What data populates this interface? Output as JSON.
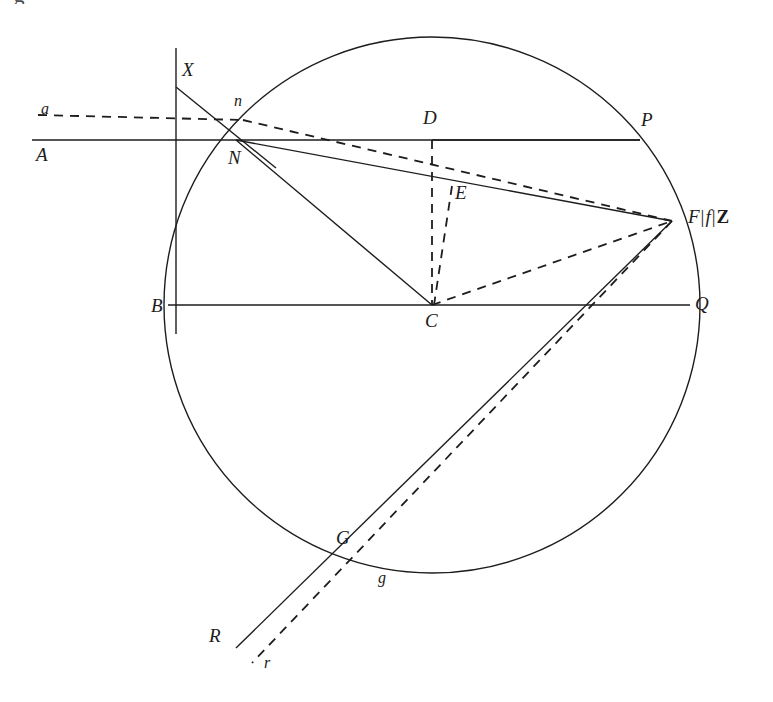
{
  "figure": {
    "domain_note": "Geometric optics ray diagram with circle, chords and refracted rays",
    "caption_remnant": "g",
    "stroke_color": "#1d1d1d",
    "background_color": "#ffffff",
    "solid_stroke_width": 1.4,
    "dashed_stroke_width": 1.8,
    "dash_pattern": "9 7"
  },
  "labels": [
    {
      "id": "label-a",
      "text": "a",
      "x": 41,
      "y": 101,
      "style": "lower"
    },
    {
      "id": "label-A",
      "text": "A",
      "x": 36,
      "y": 145,
      "style": "upper"
    },
    {
      "id": "label-X",
      "text": "X",
      "x": 182,
      "y": 60,
      "style": "upper"
    },
    {
      "id": "label-n",
      "text": "n",
      "x": 234,
      "y": 93,
      "style": "lower"
    },
    {
      "id": "label-N",
      "text": "N",
      "x": 228,
      "y": 148,
      "style": "upper"
    },
    {
      "id": "label-B",
      "text": "B",
      "x": 151,
      "y": 296,
      "style": "upper"
    },
    {
      "id": "label-D",
      "text": "D",
      "x": 423,
      "y": 108,
      "style": "upper"
    },
    {
      "id": "label-E",
      "text": "E",
      "x": 455,
      "y": 183,
      "style": "upper"
    },
    {
      "id": "label-C",
      "text": "C",
      "x": 425,
      "y": 311,
      "style": "upper"
    },
    {
      "id": "label-P",
      "text": "P",
      "x": 641,
      "y": 110,
      "style": "upper"
    },
    {
      "id": "label-Q",
      "text": "Q",
      "x": 695,
      "y": 294,
      "style": "upper"
    },
    {
      "id": "label-G",
      "text": "G",
      "x": 336,
      "y": 528,
      "style": "upper"
    },
    {
      "id": "label-g",
      "text": "g",
      "x": 378,
      "y": 570,
      "style": "lower"
    },
    {
      "id": "label-R",
      "text": "R",
      "x": 209,
      "y": 626,
      "style": "upper"
    },
    {
      "id": "label-r",
      "text": "r",
      "x": 264,
      "y": 655,
      "style": "lower"
    }
  ],
  "focus_label": {
    "id": "label-focus-F-f-Z",
    "text": "F|f|Z",
    "parts": {
      "F": "F",
      "sep1": "|",
      "f": "f",
      "sep2": "|",
      "Z": "Z"
    },
    "x": 688,
    "y": 207
  },
  "geometry": {
    "circle": {
      "cx": 432,
      "cy": 305,
      "r": 268
    },
    "points": {
      "X": {
        "x": 176,
        "y": 87
      },
      "n": {
        "x": 243,
        "y": 120
      },
      "N": {
        "x": 236,
        "y": 140
      },
      "B": {
        "x": 172,
        "y": 305
      },
      "C": {
        "x": 432,
        "y": 305
      },
      "D": {
        "x": 432,
        "y": 140
      },
      "E": {
        "x": 449,
        "y": 196
      },
      "P": {
        "x": 640,
        "y": 140
      },
      "Q": {
        "x": 690,
        "y": 305
      },
      "F": {
        "x": 672,
        "y": 221
      },
      "G": {
        "x": 357,
        "y": 558
      },
      "g": {
        "x": 370,
        "y": 570
      },
      "R": {
        "x": 236,
        "y": 648
      },
      "r": {
        "x": 252,
        "y": 663
      }
    },
    "solid_segments": [
      {
        "name": "axis-A-to-P",
        "x1": 32,
        "y1": 140,
        "x2": 640,
        "y2": 140
      },
      {
        "name": "chord-B-to-Q",
        "x1": 168,
        "y1": 305,
        "x2": 690,
        "y2": 305
      },
      {
        "name": "vertical-tangent",
        "x1": 176,
        "y1": 48,
        "x2": 176,
        "y2": 334
      },
      {
        "name": "ray-X-to-N-extended",
        "x1": 176,
        "y1": 87,
        "x2": 276,
        "y2": 168
      },
      {
        "name": "ray-N-to-F",
        "x1": 236,
        "y1": 140,
        "x2": 672,
        "y2": 221
      },
      {
        "name": "ray-N-to-C",
        "x1": 236,
        "y1": 140,
        "x2": 432,
        "y2": 305
      },
      {
        "name": "ray-F-to-R",
        "x1": 672,
        "y1": 221,
        "x2": 236,
        "y2": 648
      },
      {
        "name": "chord-D-to-P-top",
        "x1": 432,
        "y1": 140,
        "x2": 640,
        "y2": 140
      }
    ],
    "dashed_segments": [
      {
        "name": "dashed-ray-a-to-n",
        "x1": 38,
        "y1": 115,
        "x2": 243,
        "y2": 120
      },
      {
        "name": "dashed-ray-n-to-F",
        "x1": 243,
        "y1": 120,
        "x2": 672,
        "y2": 221
      },
      {
        "name": "dashed-D-to-C",
        "x1": 432,
        "y1": 140,
        "x2": 432,
        "y2": 305
      },
      {
        "name": "dashed-E-to-C",
        "x1": 452,
        "y1": 186,
        "x2": 434,
        "y2": 305
      },
      {
        "name": "dashed-C-to-F",
        "x1": 432,
        "y1": 305,
        "x2": 672,
        "y2": 221
      },
      {
        "name": "dashed-F-to-r",
        "x1": 672,
        "y1": 221,
        "x2": 252,
        "y2": 663
      }
    ]
  }
}
